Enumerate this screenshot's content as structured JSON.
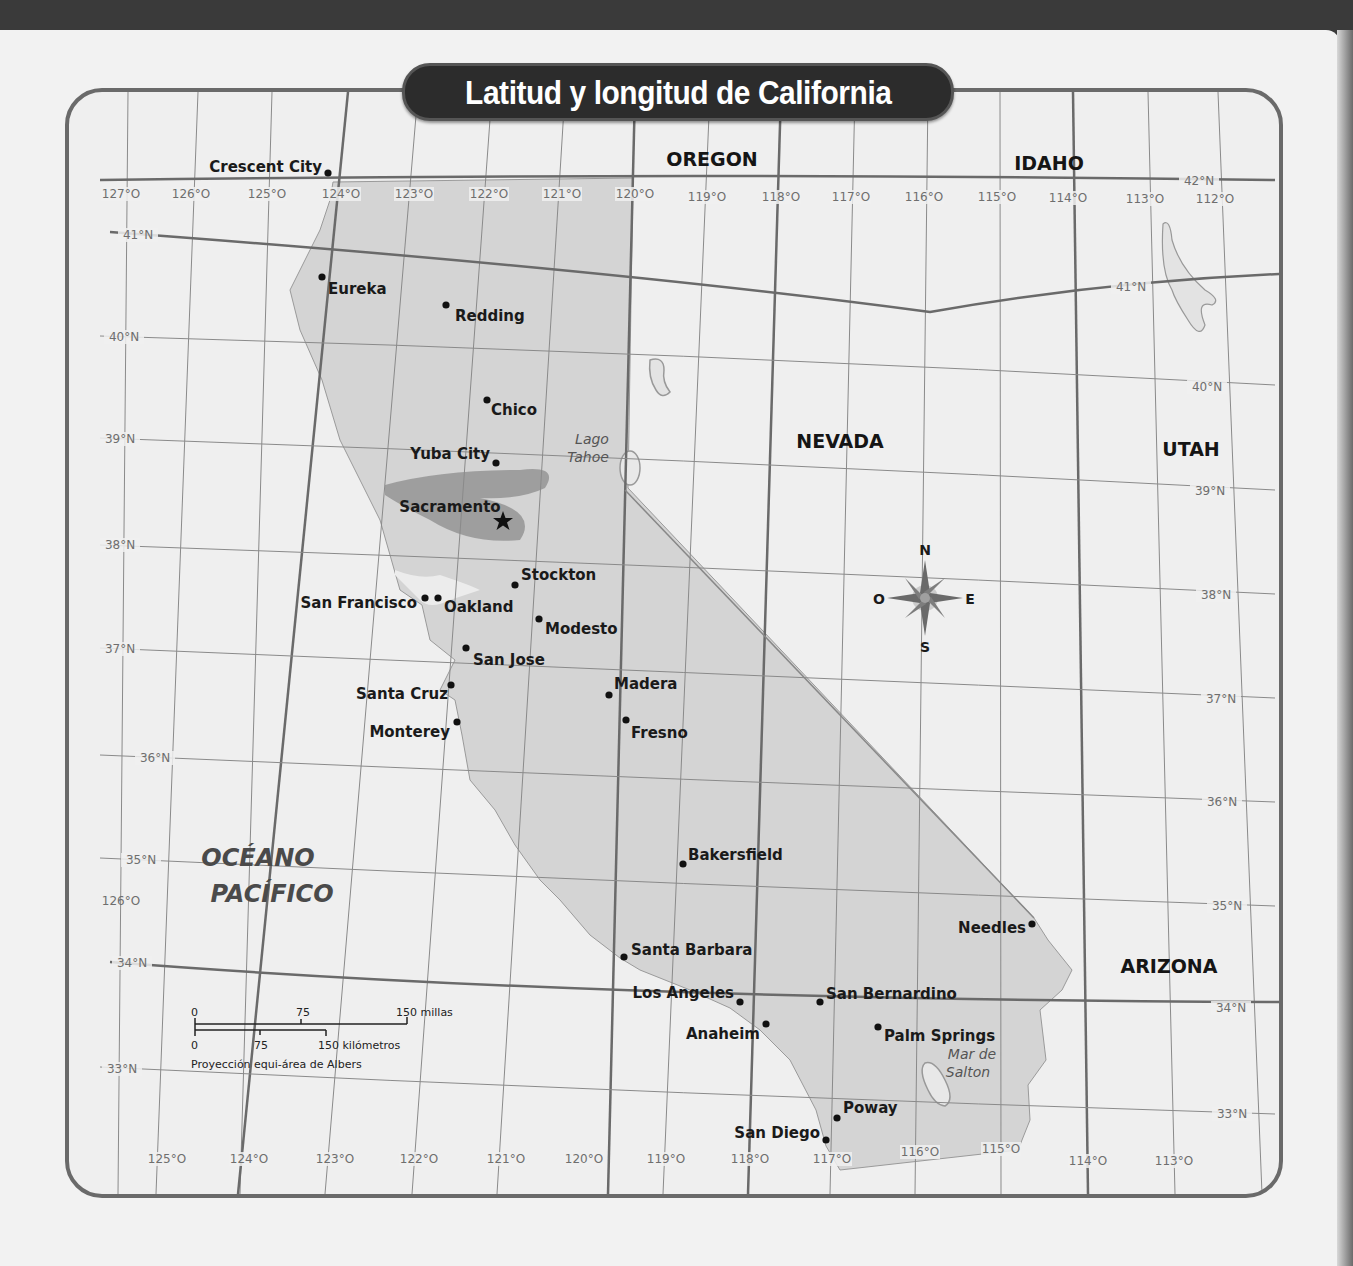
{
  "title": "Latitud y longitud de California",
  "states": [
    {
      "name": "OREGON",
      "x": 712,
      "y": 166
    },
    {
      "name": "IDAHO",
      "x": 1049,
      "y": 170
    },
    {
      "name": "NEVADA",
      "x": 840,
      "y": 448
    },
    {
      "name": "UTAH",
      "x": 1191,
      "y": 456
    },
    {
      "name": "ARIZONA",
      "x": 1169,
      "y": 973
    }
  ],
  "ocean": {
    "line1": "OCÉANO",
    "line2": "PACÍFICO"
  },
  "water_bodies": [
    {
      "line1": "Lago",
      "line2": "Tahoe",
      "x": 592,
      "y": 444
    },
    {
      "line1": "Mar de",
      "line2": "Salton",
      "x": 972,
      "y": 1059
    }
  ],
  "capital": {
    "name": "Sacramento",
    "x": 503,
    "y": 521,
    "label_x": 450,
    "label_y": 512,
    "anchor": "middle"
  },
  "cities": [
    {
      "name": "Crescent City",
      "x": 328,
      "y": 173,
      "lx": 322,
      "ly": 172,
      "anchor": "end"
    },
    {
      "name": "Eureka",
      "x": 322,
      "y": 277,
      "lx": 328,
      "ly": 294,
      "anchor": "start"
    },
    {
      "name": "Redding",
      "x": 446,
      "y": 305,
      "lx": 455,
      "ly": 321,
      "anchor": "start"
    },
    {
      "name": "Chico",
      "x": 487,
      "y": 400,
      "lx": 491,
      "ly": 415,
      "anchor": "start"
    },
    {
      "name": "Yuba City",
      "x": 496,
      "y": 463,
      "lx": 490,
      "ly": 459,
      "anchor": "end"
    },
    {
      "name": "Stockton",
      "x": 515,
      "y": 585,
      "lx": 521,
      "ly": 580,
      "anchor": "start"
    },
    {
      "name": "San Francisco",
      "x": 425,
      "y": 598,
      "lx": 417,
      "ly": 608,
      "anchor": "end"
    },
    {
      "name": "Oakland",
      "x": 438,
      "y": 598,
      "lx": 444,
      "ly": 612,
      "anchor": "start"
    },
    {
      "name": "Modesto",
      "x": 539,
      "y": 619,
      "lx": 545,
      "ly": 634,
      "anchor": "start"
    },
    {
      "name": "San Jose",
      "x": 466,
      "y": 648,
      "lx": 473,
      "ly": 665,
      "anchor": "start"
    },
    {
      "name": "Santa Cruz",
      "x": 451,
      "y": 685,
      "lx": 448,
      "ly": 699,
      "anchor": "end"
    },
    {
      "name": "Madera",
      "x": 609,
      "y": 695,
      "lx": 614,
      "ly": 689,
      "anchor": "start"
    },
    {
      "name": "Monterey",
      "x": 457,
      "y": 722,
      "lx": 450,
      "ly": 737,
      "anchor": "end"
    },
    {
      "name": "Fresno",
      "x": 626,
      "y": 720,
      "lx": 631,
      "ly": 738,
      "anchor": "start"
    },
    {
      "name": "Bakersfield",
      "x": 683,
      "y": 864,
      "lx": 688,
      "ly": 860,
      "anchor": "start"
    },
    {
      "name": "Needles",
      "x": 1032,
      "y": 924,
      "lx": 1026,
      "ly": 933,
      "anchor": "end"
    },
    {
      "name": "Santa Barbara",
      "x": 624,
      "y": 957,
      "lx": 631,
      "ly": 955,
      "anchor": "start"
    },
    {
      "name": "Los Angeles",
      "x": 740,
      "y": 1002,
      "lx": 734,
      "ly": 998,
      "anchor": "end"
    },
    {
      "name": "San Bernardino",
      "x": 820,
      "y": 1002,
      "lx": 826,
      "ly": 999,
      "anchor": "start"
    },
    {
      "name": "Anaheim",
      "x": 766,
      "y": 1024,
      "lx": 760,
      "ly": 1039,
      "anchor": "end"
    },
    {
      "name": "Palm Springs",
      "x": 878,
      "y": 1027,
      "lx": 884,
      "ly": 1041,
      "anchor": "start"
    },
    {
      "name": "Poway",
      "x": 837,
      "y": 1118,
      "lx": 843,
      "ly": 1113,
      "anchor": "start"
    },
    {
      "name": "San Diego",
      "x": 826,
      "y": 1140,
      "lx": 820,
      "ly": 1138,
      "anchor": "end"
    }
  ],
  "longitude_labels_top": [
    {
      "text": "127°O",
      "x": 121,
      "y": 198
    },
    {
      "text": "126°O",
      "x": 191,
      "y": 198
    },
    {
      "text": "125°O",
      "x": 267,
      "y": 198
    },
    {
      "text": "124°O",
      "x": 341,
      "y": 198
    },
    {
      "text": "123°O",
      "x": 414,
      "y": 198
    },
    {
      "text": "122°O",
      "x": 489,
      "y": 198
    },
    {
      "text": "121°O",
      "x": 562,
      "y": 198
    },
    {
      "text": "120°O",
      "x": 635,
      "y": 198
    },
    {
      "text": "119°O",
      "x": 707,
      "y": 201
    },
    {
      "text": "118°O",
      "x": 781,
      "y": 201
    },
    {
      "text": "117°O",
      "x": 851,
      "y": 201
    },
    {
      "text": "116°O",
      "x": 924,
      "y": 201
    },
    {
      "text": "115°O",
      "x": 997,
      "y": 201
    },
    {
      "text": "114°O",
      "x": 1068,
      "y": 202
    },
    {
      "text": "113°O",
      "x": 1145,
      "y": 203
    },
    {
      "text": "112°O",
      "x": 1215,
      "y": 203
    }
  ],
  "longitude_labels_bottom": [
    {
      "text": "125°O",
      "x": 167,
      "y": 1163
    },
    {
      "text": "124°O",
      "x": 249,
      "y": 1163
    },
    {
      "text": "123°O",
      "x": 335,
      "y": 1163
    },
    {
      "text": "122°O",
      "x": 419,
      "y": 1163
    },
    {
      "text": "121°O",
      "x": 506,
      "y": 1163
    },
    {
      "text": "120°O",
      "x": 584,
      "y": 1163
    },
    {
      "text": "119°O",
      "x": 666,
      "y": 1163
    },
    {
      "text": "118°O",
      "x": 750,
      "y": 1163
    },
    {
      "text": "117°O",
      "x": 832,
      "y": 1163
    },
    {
      "text": "116°O",
      "x": 920,
      "y": 1156
    },
    {
      "text": "115°O",
      "x": 1001,
      "y": 1153
    },
    {
      "text": "114°O",
      "x": 1088,
      "y": 1165
    },
    {
      "text": "113°O",
      "x": 1174,
      "y": 1165
    }
  ],
  "longitude_label_extra": {
    "text": "126°O",
    "x": 121,
    "y": 905
  },
  "latitude_labels_left": [
    {
      "text": "41°N",
      "x": 138,
      "y": 239
    },
    {
      "text": "40°N",
      "x": 124,
      "y": 341
    },
    {
      "text": "39°N",
      "x": 120,
      "y": 443
    },
    {
      "text": "38°N",
      "x": 120,
      "y": 549
    },
    {
      "text": "37°N",
      "x": 120,
      "y": 653
    },
    {
      "text": "36°N",
      "x": 155,
      "y": 762
    },
    {
      "text": "35°N",
      "x": 141,
      "y": 864
    },
    {
      "text": "34°N",
      "x": 132,
      "y": 967
    },
    {
      "text": "33°N",
      "x": 122,
      "y": 1073
    }
  ],
  "latitude_labels_right": [
    {
      "text": "42°N",
      "x": 1199,
      "y": 185
    },
    {
      "text": "41°N",
      "x": 1131,
      "y": 291
    },
    {
      "text": "40°N",
      "x": 1207,
      "y": 391
    },
    {
      "text": "39°N",
      "x": 1210,
      "y": 495
    },
    {
      "text": "38°N",
      "x": 1216,
      "y": 599
    },
    {
      "text": "37°N",
      "x": 1221,
      "y": 703
    },
    {
      "text": "36°N",
      "x": 1222,
      "y": 806
    },
    {
      "text": "35°N",
      "x": 1227,
      "y": 910
    },
    {
      "text": "34°N",
      "x": 1231,
      "y": 1012
    },
    {
      "text": "33°N",
      "x": 1232,
      "y": 1118
    }
  ],
  "compass": {
    "n": "N",
    "s": "S",
    "e": "E",
    "w": "O",
    "x": 925,
    "y": 598
  },
  "scale": {
    "miles": {
      "zero": "0",
      "mid": "75",
      "end": "150 millas"
    },
    "km": {
      "zero": "0",
      "mid": "75",
      "end": "150 kilómetros"
    },
    "projection": "Proyección equi-área de Albers"
  },
  "colors": {
    "land_ca": "#d4d4d4",
    "land_other": "#f0f0f0",
    "grid": "#8a8a8a",
    "border": "#555555",
    "valley": "#8c8c8c",
    "water": "#e3e3e3"
  }
}
